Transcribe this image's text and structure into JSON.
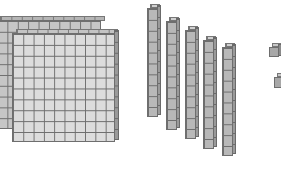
{
  "figure": {
    "title": "",
    "hundreds": {
      "count": 2,
      "grid": [
        10,
        10
      ]
    },
    "tens": {
      "count": 5,
      "cubes_per_rod": 10
    },
    "ones": {
      "count": 2
    },
    "colors": {
      "front_flat": "#dcdcdc",
      "back_flat": "#c6c6c6",
      "rod": "#b8b8b8",
      "unit": "#a8a8a8",
      "edge": "#6e6e6e"
    }
  }
}
